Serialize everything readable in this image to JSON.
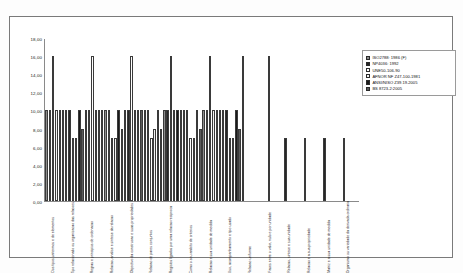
{
  "chart_data": {
    "type": "bar",
    "title": "",
    "xlabel": "",
    "ylabel": "",
    "ylim": [
      0,
      18
    ],
    "ytick_step": 2,
    "grid": false,
    "legend_position": "right",
    "yticks": [
      "0,00",
      "2,00",
      "4,00",
      "6,00",
      "8,00",
      "10,00",
      "12,00",
      "14,00",
      "16,00",
      "18,00"
    ],
    "categories": [
      "Dos tipos unitermos e de elementos",
      "Tipo relacionado ou organizacao das relacoes",
      "Regras e principios de ordenacao",
      "Relacao, analise e sintese da relacao",
      "Objectivo da construcao e suas propriedades",
      "Relacao de pares conjuntos",
      "Registos ligados por uma relacao reciproca",
      "Como o seu ambito de criterios",
      "Relacao e sua unidade de medida",
      "Uso, acompanhamento e tipo usado",
      "Relacao uniforme",
      "Fases entre o valor, nulo e por unidade",
      "Relacao, sintese e sua unidade",
      "Relacao e a sua propriedade",
      "Matriz e a sua unidade de medida",
      "Organismo ou variedade da derivada ordinaria"
    ],
    "series": [
      {
        "name": "ISO2788: 1986 (F)",
        "color": "#8c8c8c",
        "values": [
          10,
          10,
          10,
          10,
          10,
          10,
          10,
          10,
          10,
          10,
          16,
          0,
          0,
          0,
          0,
          0
        ]
      },
      {
        "name": "NP4036: 1992",
        "color": "#262626",
        "values": [
          10,
          10,
          10,
          10,
          10,
          10,
          10,
          10,
          10,
          10,
          0,
          0,
          7,
          7,
          7,
          7
        ]
      },
      {
        "name": "UNE50-106-90",
        "color": "#ffffff",
        "values": [
          16,
          7,
          16,
          7,
          16,
          7,
          16,
          7,
          16,
          7,
          0,
          16,
          0,
          0,
          0,
          0
        ]
      },
      {
        "name": "AFNOR NF Z47-100-1981",
        "color": "#f2f2f2",
        "values": [
          10,
          7,
          10,
          7,
          10,
          8,
          10,
          7,
          10,
          7,
          0,
          0,
          0,
          0,
          0,
          0
        ]
      },
      {
        "name": "ANSI/NISO Z39.19-2005",
        "color": "#1a1a1a",
        "values": [
          10,
          10,
          10,
          10,
          10,
          10,
          10,
          10,
          10,
          10,
          0,
          0,
          0,
          0,
          0,
          0
        ]
      },
      {
        "name": "BS 8723-2:2005",
        "color": "#595959",
        "values": [
          10,
          8,
          10,
          8,
          10,
          8,
          10,
          8,
          10,
          8,
          0,
          0,
          0,
          0,
          0,
          0
        ]
      }
    ]
  }
}
